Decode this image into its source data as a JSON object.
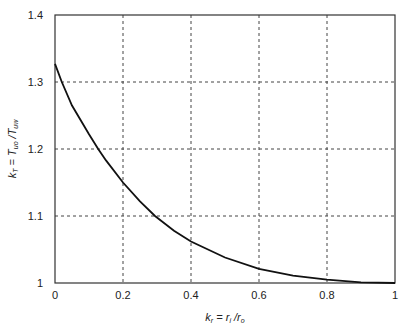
{
  "chart_data": {
    "type": "line",
    "title": "",
    "xlabel": "k_r = r_i / r_o",
    "ylabel": "k_T = T_uo / T_uw",
    "xlim": [
      0,
      1
    ],
    "ylim": [
      1,
      1.4
    ],
    "xticks": [
      "0",
      "0.2",
      "0.4",
      "0.6",
      "0.8",
      "1"
    ],
    "yticks": [
      "1",
      "1.1",
      "1.2",
      "1.3",
      "1.4"
    ],
    "grid": true,
    "legend": null,
    "series": [
      {
        "name": "k_T",
        "x": [
          0,
          0.02,
          0.05,
          0.1,
          0.127,
          0.15,
          0.2,
          0.25,
          0.294,
          0.35,
          0.4,
          0.5,
          0.6,
          0.7,
          0.8,
          0.9,
          1.0
        ],
        "values": [
          1.327,
          1.3,
          1.265,
          1.222,
          1.2,
          1.183,
          1.15,
          1.122,
          1.1,
          1.078,
          1.062,
          1.038,
          1.021,
          1.011,
          1.005,
          1.001,
          1.0
        ]
      }
    ]
  },
  "labels": {
    "x_main": "k",
    "x_sub": "r",
    "x_eq": " = r",
    "x_sub2": "i",
    "x_slash": " /r",
    "x_sub3": "o",
    "y_main": "k",
    "y_sub": "T",
    "y_eq": " = T",
    "y_sub2": "uo",
    "y_slash": " /T",
    "y_sub3": "uw"
  }
}
